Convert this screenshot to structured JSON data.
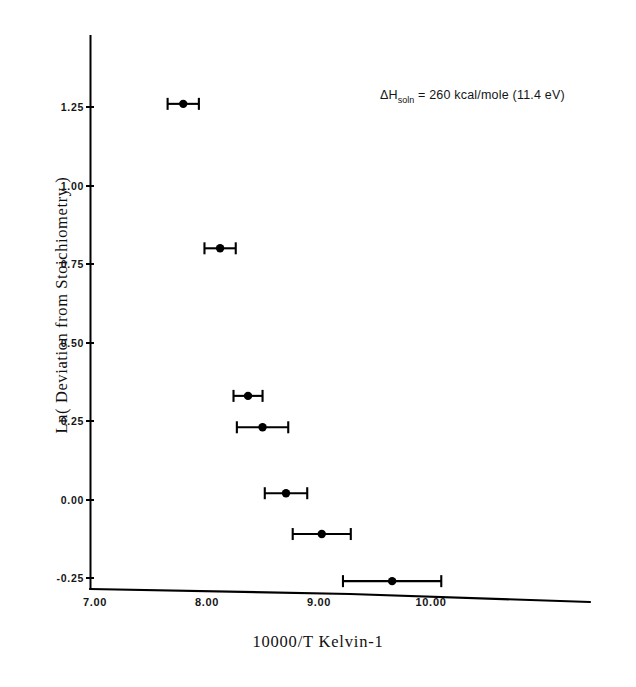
{
  "chart_data": {
    "type": "scatter",
    "title": "",
    "xlabel": "10000/T  Kelvin-1",
    "ylabel": "Ln( Deviation from Stoichiometry )",
    "xlim": [
      7.0,
      11.4
    ],
    "ylim": [
      -0.3,
      1.42
    ],
    "grid": false,
    "legend": null,
    "xticks": [
      {
        "value": 7.0,
        "label": "7.00"
      },
      {
        "value": 8.0,
        "label": "8.00"
      },
      {
        "value": 9.0,
        "label": "9.00"
      },
      {
        "value": 10.0,
        "label": "10.00"
      }
    ],
    "yticks": [
      {
        "value": 1.25,
        "label": "1.25"
      },
      {
        "value": 1.0,
        "label": "1.00"
      },
      {
        "value": 0.75,
        "label": "0.75"
      },
      {
        "value": 0.5,
        "label": "0.50"
      },
      {
        "value": 0.25,
        "label": "0.25"
      },
      {
        "value": 0.0,
        "label": "0.00"
      },
      {
        "value": -0.25,
        "label": "-0.25"
      }
    ],
    "series": [
      {
        "name": "measurements",
        "marker": "filled-circle",
        "color": "#000000",
        "error_bars": "x",
        "points": [
          {
            "x": 7.79,
            "y": 1.26,
            "xerr": 0.14
          },
          {
            "x": 8.12,
            "y": 0.8,
            "xerr": 0.14
          },
          {
            "x": 8.37,
            "y": 0.33,
            "xerr": 0.13
          },
          {
            "x": 8.5,
            "y": 0.23,
            "xerr": 0.23
          },
          {
            "x": 8.71,
            "y": 0.02,
            "xerr": 0.19
          },
          {
            "x": 9.03,
            "y": -0.11,
            "xerr": 0.26
          },
          {
            "x": 9.66,
            "y": -0.26,
            "xerr": 0.44
          }
        ]
      }
    ],
    "annotations": [
      {
        "id": "enthalpy-of-solution",
        "symbol": "ΔH",
        "subscript": "soln",
        "text": " =  260  kcal/mole  (11.4  eV)",
        "full_text": "ΔHsoln = 260 kcal/mole (11.4 eV)",
        "x": 380,
        "y": 88
      }
    ]
  },
  "figure": {
    "background_color": "#ffffff",
    "ink_color": "#000000"
  }
}
